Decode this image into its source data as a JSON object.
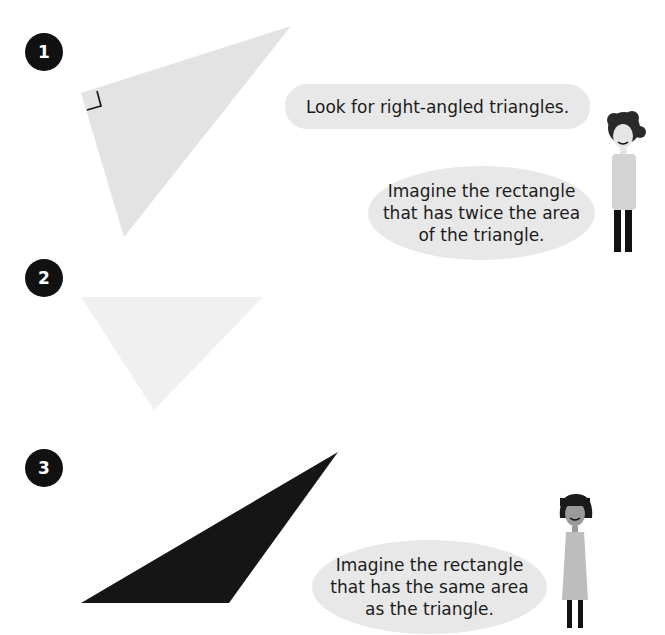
{
  "items": [
    {
      "number": "1",
      "fill": "#e3e3e3",
      "right_angle_marker": true
    },
    {
      "number": "2",
      "fill": "#f0f0f0",
      "right_angle_marker": false
    },
    {
      "number": "3",
      "fill": "#151515",
      "right_angle_marker": false
    }
  ],
  "speech_bubbles": [
    {
      "speaker": "boy",
      "text": "Look for right-angled triangles."
    },
    {
      "speaker": "boy",
      "text": "Imagine the rectangle\nthat has twice the area\nof the triangle."
    },
    {
      "speaker": "girl",
      "text": "Imagine the rectangle\nthat has the same area\nas the triangle."
    }
  ],
  "colors": {
    "badge": "#111111",
    "bubble": "#e8e8e8",
    "text": "#1c1c1c"
  }
}
